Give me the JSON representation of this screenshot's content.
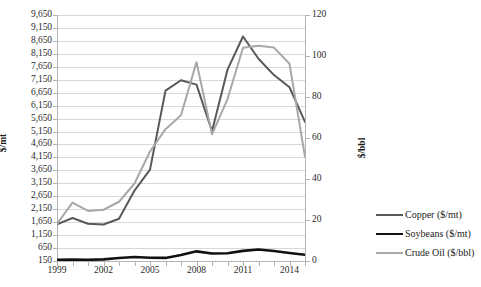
{
  "chart_data": {
    "type": "line",
    "title": "",
    "xlabel": "",
    "ylabel": "$/mt",
    "ylabel_secondary": "$/bbl",
    "grid": true,
    "legend_position": "right",
    "x": [
      1999,
      2000,
      2001,
      2002,
      2003,
      2004,
      2005,
      2006,
      2007,
      2008,
      2009,
      2010,
      2011,
      2012,
      2013,
      2014,
      2015
    ],
    "xtick_labels": [
      "1999",
      "2002",
      "2005",
      "2008",
      "2011",
      "2014"
    ],
    "xtick_values": [
      1999,
      2002,
      2005,
      2008,
      2011,
      2014
    ],
    "ylim": [
      150,
      9650
    ],
    "ytick_labels": [
      "9,650",
      "9,150",
      "8,650",
      "8,150",
      "7,650",
      "7,150",
      "6,650",
      "6,150",
      "5,650",
      "5,150",
      "4,650",
      "4,150",
      "3,650",
      "3,150",
      "2,650",
      "2,150",
      "1,650",
      "1,150",
      "650",
      "150"
    ],
    "ytick_values": [
      9650,
      9150,
      8650,
      8150,
      7650,
      7150,
      6650,
      6150,
      5650,
      5150,
      4650,
      4150,
      3650,
      3150,
      2650,
      2150,
      1650,
      1150,
      650,
      150
    ],
    "ylim_secondary": [
      0,
      120
    ],
    "ytick_labels_secondary": [
      "120",
      "100",
      "80",
      "60",
      "40",
      "20",
      "0"
    ],
    "ytick_values_secondary": [
      120,
      100,
      80,
      60,
      40,
      20,
      0
    ],
    "series": [
      {
        "name": "Copper ($/mt)",
        "axis": "left",
        "color": "#595959",
        "width": 2.0,
        "values": [
          1570,
          1810,
          1590,
          1560,
          1780,
          2870,
          3680,
          6730,
          7130,
          6960,
          5160,
          7540,
          8820,
          7960,
          7330,
          6860,
          5520
        ]
      },
      {
        "name": "Soybeans ($/mt)",
        "axis": "left",
        "color": "#111111",
        "width": 2.6,
        "values": [
          200,
          210,
          196,
          213,
          265,
          307,
          275,
          269,
          384,
          523,
          437,
          450,
          540,
          592,
          538,
          458,
          390
        ]
      },
      {
        "name": "Crude Oil ($/bbl)",
        "axis": "right",
        "color": "#a8a8a8",
        "width": 2.0,
        "values": [
          18.1,
          28.5,
          24.4,
          25.0,
          28.9,
          37.8,
          53.4,
          64.3,
          71.1,
          97.0,
          61.8,
          79.0,
          104.0,
          105.0,
          104.1,
          96.2,
          50.8
        ]
      }
    ]
  },
  "legend": {
    "items": [
      {
        "label": "Copper ($/mt)",
        "color": "#595959",
        "width": 2.0
      },
      {
        "label": "Soybeans ($/mt)",
        "color": "#111111",
        "width": 2.8
      },
      {
        "label": "Crude Oil ($/bbl)",
        "color": "#a8a8a8",
        "width": 2.0
      }
    ]
  }
}
